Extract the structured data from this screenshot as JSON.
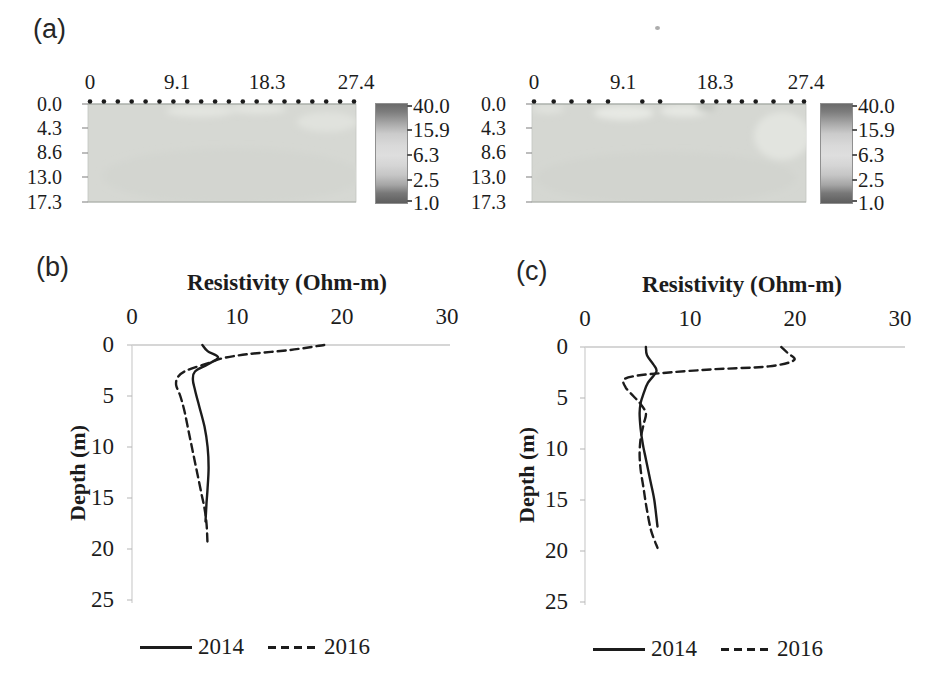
{
  "panels": {
    "a": {
      "label": "(a)"
    },
    "b": {
      "label": "(b)"
    },
    "c": {
      "label": "(c)"
    }
  },
  "panel_a": {
    "colorbar_ticks": [
      "40.0",
      "15.9",
      "6.3",
      "2.5",
      "1.0"
    ],
    "colorbar_range": [
      1.0,
      40.0
    ],
    "sections": [
      {
        "x_ticks": [
          "0",
          "9.1",
          "18.3",
          "27.4"
        ],
        "depth_ticks": [
          "0.0",
          "4.3",
          "8.6",
          "13.0",
          "17.3"
        ],
        "electrode_fractions": [
          0,
          0.0526,
          0.1053,
          0.1579,
          0.2105,
          0.2632,
          0.3158,
          0.3684,
          0.4211,
          0.4737,
          0.5263,
          0.5789,
          0.6316,
          0.6842,
          0.7368,
          0.7895,
          0.8421,
          0.8947,
          0.9474,
          1.0
        ]
      },
      {
        "x_ticks": [
          "0",
          "9.1",
          "18.3",
          "27.4"
        ],
        "depth_ticks": [
          "0.0",
          "4.3",
          "8.6",
          "13.0",
          "17.3"
        ],
        "electrode_fractions": [
          0,
          0.073,
          0.139,
          0.204,
          0.274,
          0.401,
          0.467,
          0.624,
          0.675,
          0.723,
          0.77,
          0.821,
          0.887,
          0.953,
          1.0
        ]
      }
    ],
    "colors": {
      "section_base": "#d6d8d3",
      "section_light": "#e6e8e3",
      "electrode": "#1b1b1b",
      "colorbar_dark": "#646464",
      "colorbar_light": "#dedede"
    }
  },
  "chart_data": [
    {
      "type": "line",
      "panel": "(b)",
      "title": "Resistivity (Ohm-m)",
      "xlabel": "Resistivity (Ohm-m)",
      "ylabel": "Depth (m)",
      "x_axis_position": "top",
      "xlim": [
        0,
        30
      ],
      "depth_lim": [
        0,
        25
      ],
      "x_ticks": [
        "0",
        "10",
        "20",
        "30"
      ],
      "y_ticks": [
        "0",
        "5",
        "10",
        "15",
        "20",
        "25"
      ],
      "grid": false,
      "legend_position": "bottom",
      "legend": [
        {
          "label": "2014",
          "style": "solid"
        },
        {
          "label": "2016",
          "style": "dashed"
        }
      ],
      "series": [
        {
          "name": "2014",
          "style": "solid",
          "points": [
            [
              6.7,
              0
            ],
            [
              7.2,
              0.6
            ],
            [
              8.2,
              1.2
            ],
            [
              7.2,
              1.9
            ],
            [
              6.0,
              2.6
            ],
            [
              5.8,
              3.4
            ],
            [
              6.0,
              4.4
            ],
            [
              6.4,
              6
            ],
            [
              6.9,
              8
            ],
            [
              7.2,
              10
            ],
            [
              7.3,
              12
            ],
            [
              7.2,
              14
            ],
            [
              7.1,
              15.5
            ],
            [
              7.0,
              17.3
            ]
          ]
        },
        {
          "name": "2016",
          "style": "dashed",
          "points": [
            [
              18.3,
              0
            ],
            [
              15,
              0.5
            ],
            [
              11,
              0.9
            ],
            [
              8.6,
              1.3
            ],
            [
              7.5,
              1.7
            ],
            [
              5.2,
              2.5
            ],
            [
              4.4,
              3.1
            ],
            [
              4.2,
              3.9
            ],
            [
              4.6,
              5
            ],
            [
              5.0,
              6.5
            ],
            [
              5.4,
              8.5
            ],
            [
              5.8,
              10.5
            ],
            [
              6.2,
              12.5
            ],
            [
              6.6,
              14.5
            ],
            [
              6.9,
              16
            ],
            [
              7.1,
              17.5
            ],
            [
              7.2,
              19.7
            ]
          ]
        }
      ]
    },
    {
      "type": "line",
      "panel": "(c)",
      "title": "Resistivity (Ohm-m)",
      "xlabel": "Resistivity (Ohm-m)",
      "ylabel": "Depth (m)",
      "x_axis_position": "top",
      "xlim": [
        0,
        30
      ],
      "depth_lim": [
        0,
        25
      ],
      "x_ticks": [
        "0",
        "10",
        "20",
        "30"
      ],
      "y_ticks": [
        "0",
        "5",
        "10",
        "15",
        "20",
        "25"
      ],
      "grid": false,
      "legend_position": "bottom",
      "legend": [
        {
          "label": "2014",
          "style": "solid"
        },
        {
          "label": "2016",
          "style": "dashed"
        }
      ],
      "series": [
        {
          "name": "2014",
          "style": "solid",
          "points": [
            [
              5.8,
              0
            ],
            [
              5.9,
              0.8
            ],
            [
              6.5,
              1.7
            ],
            [
              6.8,
              2.4
            ],
            [
              6.0,
              3.5
            ],
            [
              5.6,
              4.5
            ],
            [
              5.3,
              5.5
            ],
            [
              5.2,
              6.5
            ],
            [
              5.3,
              8
            ],
            [
              5.5,
              9.5
            ],
            [
              5.8,
              11
            ],
            [
              6.2,
              13
            ],
            [
              6.6,
              15
            ],
            [
              6.9,
              17.6
            ]
          ]
        },
        {
          "name": "2016",
          "style": "dashed",
          "points": [
            [
              18.7,
              0
            ],
            [
              19.3,
              0.6
            ],
            [
              19.9,
              1.3
            ],
            [
              17.5,
              1.9
            ],
            [
              12,
              2.2
            ],
            [
              8,
              2.5
            ],
            [
              5,
              2.8
            ],
            [
              3.7,
              3.2
            ],
            [
              3.9,
              4.0
            ],
            [
              4.6,
              4.8
            ],
            [
              5.3,
              5.6
            ],
            [
              5.8,
              6.5
            ],
            [
              5.6,
              7.5
            ],
            [
              5.3,
              9
            ],
            [
              5.2,
              10.5
            ],
            [
              5.3,
              12
            ],
            [
              5.6,
              14
            ],
            [
              5.9,
              16
            ],
            [
              6.3,
              18
            ],
            [
              6.9,
              19.7
            ]
          ]
        }
      ]
    }
  ]
}
